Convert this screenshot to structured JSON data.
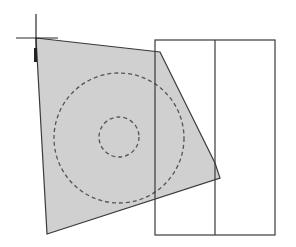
{
  "diagram": {
    "width": 296,
    "height": 247,
    "colors": {
      "background": "#ffffff",
      "fill": "#d0d0d0",
      "stroke": "#3a3a3a",
      "dashed": "#555555"
    },
    "crosshair": {
      "x": 36,
      "y": 38,
      "h_from": 16,
      "h_to": 58,
      "v_from": 14,
      "v_to": 62
    },
    "polygon": {
      "points": [
        [
          36,
          38
        ],
        [
          160,
          52
        ],
        [
          215,
          163
        ],
        [
          220,
          178
        ],
        [
          47,
          234
        ]
      ]
    },
    "circles": [
      {
        "name": "outer-circle",
        "cx": 119,
        "cy": 138,
        "r": 65,
        "dashed": true
      },
      {
        "name": "inner-circle",
        "cx": 119,
        "cy": 137,
        "r": 20,
        "dashed": true
      }
    ],
    "rectangle": {
      "x": 155,
      "y": 40,
      "w": 120,
      "h": 195,
      "divider_x": 215
    },
    "marker": {
      "x": 34,
      "y": 48,
      "w": 3,
      "h": 14
    }
  }
}
